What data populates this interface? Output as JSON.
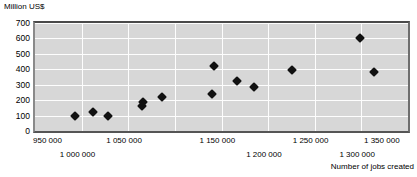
{
  "axes": {
    "y_title": "Million US$",
    "x_title": "Number of jobs created",
    "y_ticks": [
      "700",
      "600",
      "500",
      "400",
      "300",
      "200",
      "100",
      "0"
    ],
    "x_ticks": [
      "950 000",
      "1 000 000",
      "1 050 000",
      "1 150 000",
      "1 200 000",
      "1 250 000",
      "1 300 000",
      "1 350 000"
    ]
  },
  "chart_data": {
    "type": "scatter",
    "title": "",
    "xlabel": "Number of jobs created",
    "ylabel": "Million US$",
    "xlim": [
      950000,
      1350000
    ],
    "ylim": [
      0,
      700
    ],
    "xtick_values": [
      950000,
      1000000,
      1050000,
      1100000,
      1150000,
      1200000,
      1250000,
      1300000,
      1350000
    ],
    "xtick_labels": [
      "950 000",
      "1 000 000",
      "1 050 000",
      "1 100 000",
      "1 150 000",
      "1 200 000",
      "1 250 000",
      "1 300 000",
      "1 350 000"
    ],
    "xtick_labels_shown": [
      "950 000",
      "1 000 000",
      "1 050 000",
      "1 150 000",
      "1 200 000",
      "1 250 000",
      "1 300 000",
      "1 350 000"
    ],
    "ytick_values": [
      0,
      100,
      200,
      300,
      400,
      500,
      600,
      700
    ],
    "ytick_labels": [
      "0",
      "100",
      "200",
      "300",
      "400",
      "500",
      "600",
      "700"
    ],
    "grid": "both",
    "legend": "none",
    "marker": "diamond",
    "marker_color": "#111111",
    "plot_background": "#d7d7d7",
    "gridline_color": "#fdfdfd",
    "points": [
      {
        "x": 993000,
        "y": 95
      },
      {
        "x": 1012000,
        "y": 125
      },
      {
        "x": 1028000,
        "y": 100
      },
      {
        "x": 1065000,
        "y": 160
      },
      {
        "x": 1066000,
        "y": 185
      },
      {
        "x": 1086000,
        "y": 220
      },
      {
        "x": 1140000,
        "y": 240
      },
      {
        "x": 1142000,
        "y": 420
      },
      {
        "x": 1167000,
        "y": 325
      },
      {
        "x": 1185000,
        "y": 287
      },
      {
        "x": 1226000,
        "y": 395
      },
      {
        "x": 1298000,
        "y": 600
      },
      {
        "x": 1314000,
        "y": 380
      }
    ]
  }
}
